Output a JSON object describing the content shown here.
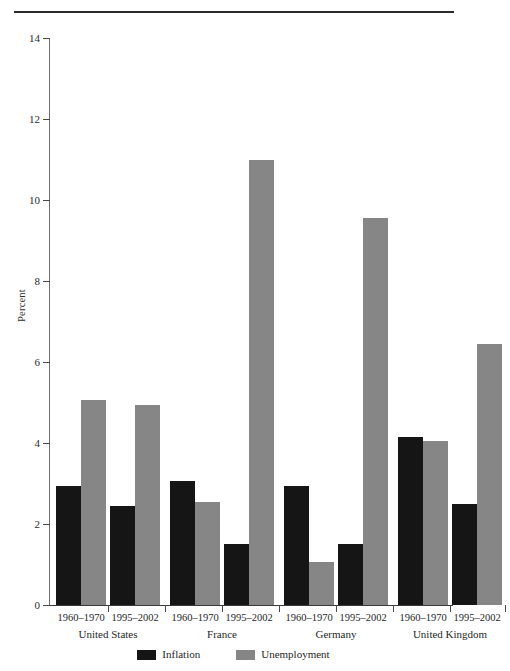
{
  "chart_data": {
    "type": "bar",
    "title": "",
    "xlabel": "",
    "ylabel": "Percent",
    "ylim": [
      0,
      14
    ],
    "ytick_values": [
      0,
      2,
      4,
      6,
      8,
      10,
      12,
      14
    ],
    "ytick_labels": [
      "0",
      "2",
      "4",
      "6",
      "8",
      "10",
      "12",
      "14"
    ],
    "grid": false,
    "legend_position": "bottom-center",
    "categories": [
      "United States 1960–1970",
      "United States 1995–2002",
      "France 1960–1970",
      "France 1995–2002",
      "Germany 1960–1970",
      "Germany 1995–2002",
      "United Kingdom 1960–1970",
      "United Kingdom 1995–2002"
    ],
    "series": [
      {
        "name": "Inflation",
        "color": "#151515",
        "values": [
          2.95,
          2.45,
          3.05,
          1.5,
          2.95,
          1.5,
          4.15,
          2.5
        ]
      },
      {
        "name": "Unemployment",
        "color": "#868686",
        "values": [
          5.05,
          4.95,
          2.55,
          11.0,
          1.05,
          9.55,
          4.05,
          6.45
        ]
      }
    ],
    "groups": [
      {
        "country": "United States",
        "periods": [
          {
            "label": "1960–1970",
            "inflation": 2.95,
            "unemployment": 5.05
          },
          {
            "label": "1995–2002",
            "inflation": 2.45,
            "unemployment": 4.95
          }
        ]
      },
      {
        "country": "France",
        "periods": [
          {
            "label": "1960–1970",
            "inflation": 3.05,
            "unemployment": 2.55
          },
          {
            "label": "1995–2002",
            "inflation": 1.5,
            "unemployment": 11.0
          }
        ]
      },
      {
        "country": "Germany",
        "periods": [
          {
            "label": "1960–1970",
            "inflation": 2.95,
            "unemployment": 1.05
          },
          {
            "label": "1995–2002",
            "inflation": 1.5,
            "unemployment": 9.55
          }
        ]
      },
      {
        "country": "United Kingdom",
        "periods": [
          {
            "label": "1960–1970",
            "inflation": 4.15,
            "unemployment": 4.05
          },
          {
            "label": "1995–2002",
            "inflation": 2.5,
            "unemployment": 6.45
          }
        ]
      }
    ]
  },
  "legend": {
    "items": [
      {
        "label": "Inflation",
        "color": "#151515"
      },
      {
        "label": "Unemployment",
        "color": "#868686"
      }
    ]
  },
  "axis": {
    "y_title": "Percent",
    "ticks": [
      "14",
      "12",
      "10",
      "8",
      "6",
      "4",
      "2",
      "0"
    ]
  }
}
